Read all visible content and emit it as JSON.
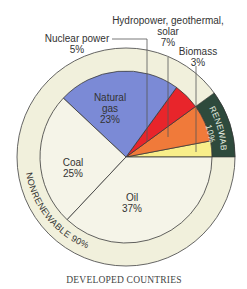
{
  "chart_data": {
    "type": "pie",
    "title": "",
    "caption": "DEVELOPED COUNTRIES",
    "slices": [
      {
        "name": "Biomass",
        "value": 3,
        "label": "Biomass",
        "pct": "3%",
        "color": "#f8ee8a",
        "group": "renewable"
      },
      {
        "name": "Hydropower, geothermal, solar",
        "value": 7,
        "label": "Hydropower, geothermal, solar",
        "pct": "7%",
        "color": "#f07a3a",
        "group": "renewable"
      },
      {
        "name": "Nuclear power",
        "value": 5,
        "label": "Nuclear power",
        "pct": "5%",
        "color": "#e8252b",
        "group": "nonrenewable"
      },
      {
        "name": "Natural gas",
        "value": 23,
        "label": "Natural gas",
        "pct": "23%",
        "color": "#7b8ad6",
        "group": "nonrenewable"
      },
      {
        "name": "Coal",
        "value": 25,
        "label": "Coal",
        "pct": "25%",
        "color": "#f5f4e8",
        "group": "nonrenewable"
      },
      {
        "name": "Oil",
        "value": 37,
        "label": "Oil",
        "pct": "37%",
        "color": "#f5f4e8",
        "group": "nonrenewable"
      }
    ],
    "groups": [
      {
        "name": "RENEWABLE",
        "pct": "10%",
        "color": "#2e4a3c"
      },
      {
        "name": "NONRENEWABLE",
        "pct": "90%",
        "color": "#f1f0dc"
      }
    ]
  },
  "labels": {
    "nuclear": {
      "line1": "Nuclear power",
      "line2": "5%"
    },
    "hydro": {
      "line1": "Hydropower, geothermal,",
      "line2": "solar",
      "line3": "7%"
    },
    "biomass": {
      "line1": "Biomass",
      "line2": "3%"
    },
    "gas": {
      "line1": "Natural",
      "line2": "gas",
      "line3": "23%"
    },
    "coal": {
      "line1": "Coal",
      "line2": "25%"
    },
    "oil": {
      "line1": "Oil",
      "line2": "37%"
    },
    "renewable": {
      "line1": "RENEWABLE",
      "line2": "10%"
    },
    "nonrenewable": "NONRENEWABLE 90%",
    "caption": "DEVELOPED COUNTRIES"
  }
}
